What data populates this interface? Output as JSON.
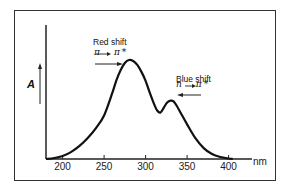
{
  "chart_data": {
    "type": "line",
    "title": "",
    "xlabel": "nm",
    "ylabel": "A",
    "xlim": [
      180,
      410
    ],
    "ylim": [
      0,
      1.05
    ],
    "x_ticks": [
      200,
      250,
      300,
      350,
      400
    ],
    "x_tick_labels": [
      "200",
      "250",
      "300",
      "350",
      "400"
    ],
    "grid": false,
    "legend": null,
    "series": [
      {
        "name": "Absorption spectrum",
        "x": [
          180,
          190,
          200,
          210,
          220,
          230,
          240,
          250,
          260,
          265,
          270,
          275,
          280,
          285,
          290,
          295,
          300,
          305,
          310,
          314,
          318,
          322,
          326,
          330,
          334,
          338,
          342,
          350,
          360,
          370,
          380,
          390,
          400,
          405
        ],
        "y": [
          0.0,
          0.01,
          0.03,
          0.07,
          0.13,
          0.21,
          0.31,
          0.44,
          0.67,
          0.8,
          0.9,
          0.97,
          1.0,
          0.99,
          0.95,
          0.88,
          0.79,
          0.67,
          0.56,
          0.49,
          0.47,
          0.52,
          0.57,
          0.59,
          0.58,
          0.53,
          0.47,
          0.35,
          0.21,
          0.11,
          0.05,
          0.02,
          0.005,
          0.0
        ]
      }
    ],
    "annotations": [
      {
        "text": "Red shift",
        "transition": "π → π*",
        "arrow_direction": "right",
        "x": 262,
        "y": 1.06
      },
      {
        "text": "Blue shift",
        "transition": "n → π*",
        "arrow_direction": "left",
        "x": 340,
        "y": 0.77
      }
    ]
  },
  "labels": {
    "y_axis": "A",
    "x_unit": "nm",
    "red_shift": "Red shift",
    "red_transition": "π → π*",
    "blue_shift": "Blue shift",
    "blue_transition": "n → π*",
    "ticks": [
      "200",
      "250",
      "300",
      "350",
      "400"
    ]
  },
  "colors": {
    "line": "#111111",
    "frame": "#333333",
    "background": "#ffffff"
  }
}
